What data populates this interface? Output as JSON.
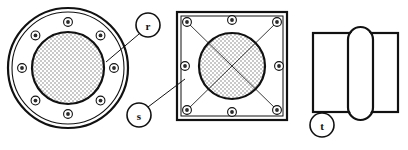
{
  "drawing": {
    "title": "Flange Detail Views",
    "background_color": "#ffffff",
    "line_color": "#111111",
    "hatch_color": "#b8b8b8",
    "width": 408,
    "height": 150
  },
  "callouts": [
    {
      "id": "r",
      "label": "r",
      "cx": 148,
      "cy": 25,
      "r": 12,
      "leader": {
        "x1": 139,
        "y1": 34,
        "x2": 106,
        "y2": 62
      },
      "refers_to": "round-flange"
    },
    {
      "id": "s",
      "label": "s",
      "cx": 139,
      "cy": 115,
      "r": 12,
      "leader": {
        "x1": 148,
        "y1": 107,
        "x2": 185,
        "y2": 79
      },
      "refers_to": "square-flange"
    },
    {
      "id": "t",
      "label": "t",
      "cx": 322,
      "cy": 125,
      "r": 12,
      "leader": null,
      "refers_to": "side-section-view"
    }
  ],
  "round_flange": {
    "name": "round-flange",
    "center": {
      "cx": 68,
      "cy": 68
    },
    "outer_radius": 60,
    "outer_inner_radius": 56,
    "bore_radius": 36,
    "bolt_circle_radius": 46,
    "bolt_count": 8,
    "bolt_hole_radius": 4.4,
    "bolt_core_radius": 1.9,
    "bolt_angles_deg": [
      270,
      315,
      0,
      45,
      90,
      135,
      180,
      225
    ],
    "bore_hatched": true
  },
  "square_flange": {
    "name": "square-flange",
    "rect": {
      "x": 177,
      "y": 12,
      "width": 110,
      "height": 108
    },
    "inner_rect_inset": 4,
    "center": {
      "cx": 232,
      "cy": 66
    },
    "bore_radius": 33,
    "bolt_count": 8,
    "bolt_hole_radius": 4.4,
    "bolt_core_radius": 1.9,
    "bolt_positions": [
      {
        "cx": 187,
        "cy": 22
      },
      {
        "cx": 232,
        "cy": 20
      },
      {
        "cx": 277,
        "cy": 22
      },
      {
        "cx": 279,
        "cy": 66
      },
      {
        "cx": 277,
        "cy": 110
      },
      {
        "cx": 232,
        "cy": 112
      },
      {
        "cx": 187,
        "cy": 110
      },
      {
        "cx": 185,
        "cy": 66
      }
    ],
    "diagonals": [
      {
        "x1": 187,
        "y1": 22,
        "x2": 277,
        "y2": 110
      },
      {
        "x1": 277,
        "y1": 22,
        "x2": 187,
        "y2": 110
      }
    ],
    "bore_hatched": true
  },
  "side_section_view": {
    "name": "side-section-view",
    "rect": {
      "x": 313,
      "y": 33,
      "width": 85,
      "height": 79
    },
    "capsule": {
      "x": 348,
      "y": 27,
      "width": 25,
      "height": 93,
      "corner_radius": 12.5
    },
    "description": "rectangle with vertical capsule overlap"
  }
}
